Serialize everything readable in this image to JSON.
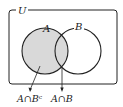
{
  "diagram": {
    "type": "venn",
    "universe_label": "U",
    "sets": [
      {
        "label": "A",
        "shaded": true
      },
      {
        "label": "B",
        "shaded": false
      }
    ],
    "annotations": [
      {
        "label": "A∩Bᶜ",
        "points_to": "A minus B region"
      },
      {
        "label": "A∩B",
        "points_to": "intersection of A and B"
      }
    ],
    "colors": {
      "shade": "#d9d9d9",
      "stroke": "#222222",
      "background": "#ffffff"
    }
  }
}
